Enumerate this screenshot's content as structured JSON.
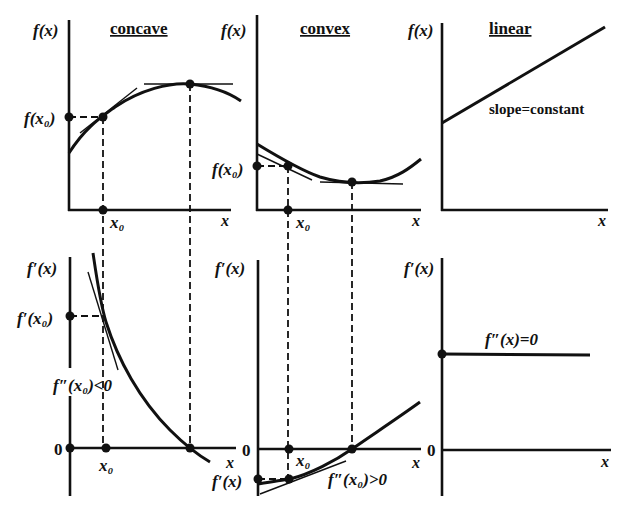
{
  "panels": {
    "concave": {
      "title": "concave",
      "top": {
        "ylabel": "f(x)",
        "point_label_y": "f(x₀)",
        "xlabel": "x",
        "point_label_x": "x₀"
      },
      "bottom": {
        "ylabel": "f′(x)",
        "point_label_y": "f′(x₀)",
        "zero": "0",
        "xlabel": "x",
        "point_label_x": "x₀",
        "annotation": "f″(x₀)<0"
      }
    },
    "convex": {
      "title": "convex",
      "top": {
        "ylabel": "f(x)",
        "point_label_y": "f(x₀)",
        "xlabel": "x",
        "point_label_x": "x₀"
      },
      "bottom": {
        "ylabel": "f′(x)",
        "point_label_y": "f′(x)",
        "zero": "0",
        "xlabel": "x",
        "point_label_x": "x₀",
        "annotation": "f″(x₀)>0"
      }
    },
    "linear": {
      "title": "linear",
      "top": {
        "ylabel": "f(x)",
        "xlabel": "x",
        "annotation": "slope=constant"
      },
      "bottom": {
        "ylabel": "f′(x)",
        "zero": "0",
        "xlabel": "x",
        "annotation": "f″(x)=0"
      }
    }
  },
  "colors": {
    "ink": "#111111",
    "background": "#ffffff"
  }
}
